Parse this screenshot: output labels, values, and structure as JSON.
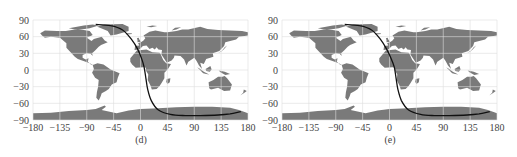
{
  "chart_data": [
    {
      "type": "line",
      "panel_label": "(d)",
      "title": "",
      "xlabel": "",
      "ylabel": "",
      "xlim": [
        -180,
        180
      ],
      "ylim": [
        -90,
        90
      ],
      "xticks": [
        -180,
        -135,
        -90,
        -45,
        0,
        45,
        90,
        135,
        180
      ],
      "yticks": [
        90,
        60,
        30,
        0,
        -30,
        -60,
        -90
      ],
      "grid": true,
      "background": "world map (land in grey)",
      "series": [
        {
          "name": "ground track",
          "color": "#111111",
          "x": [
            -75,
            -50,
            -30,
            -15,
            -5,
            2,
            6,
            9,
            12,
            18,
            30,
            50,
            75,
            100,
            130,
            150,
            168
          ],
          "y": [
            82,
            80,
            72,
            55,
            38,
            20,
            5,
            -15,
            -35,
            -55,
            -72,
            -80,
            -82,
            -82,
            -81,
            -79,
            -75
          ]
        }
      ]
    },
    {
      "type": "line",
      "panel_label": "(e)",
      "title": "",
      "xlabel": "",
      "ylabel": "",
      "xlim": [
        -180,
        180
      ],
      "ylim": [
        -90,
        90
      ],
      "xticks": [
        -180,
        -135,
        -90,
        -45,
        0,
        45,
        90,
        135,
        180
      ],
      "yticks": [
        90,
        60,
        30,
        0,
        -30,
        -60,
        -90
      ],
      "grid": true,
      "background": "world map (land in grey)",
      "series": [
        {
          "name": "ground track",
          "color": "#111111",
          "x": [
            -75,
            -50,
            -30,
            -15,
            -5,
            3,
            8,
            11,
            14,
            20,
            32,
            52,
            75,
            100,
            130,
            150,
            168
          ],
          "y": [
            82,
            80,
            72,
            55,
            38,
            20,
            5,
            -15,
            -35,
            -55,
            -72,
            -80,
            -82,
            -82,
            -81,
            -79,
            -75
          ]
        }
      ]
    }
  ],
  "panels": [
    {
      "caption": "(d)"
    },
    {
      "caption": "(e)"
    }
  ],
  "axis": {
    "xtick_labels": [
      "−180",
      "−135",
      "−90",
      "−45",
      "0",
      "45",
      "90",
      "135",
      "180"
    ],
    "ytick_labels": [
      "90",
      "60",
      "30",
      "0",
      "−30",
      "−60",
      "−90"
    ]
  },
  "colors": {
    "land": "#7a7a7a",
    "grid": "#dddddd",
    "track": "#111111"
  }
}
